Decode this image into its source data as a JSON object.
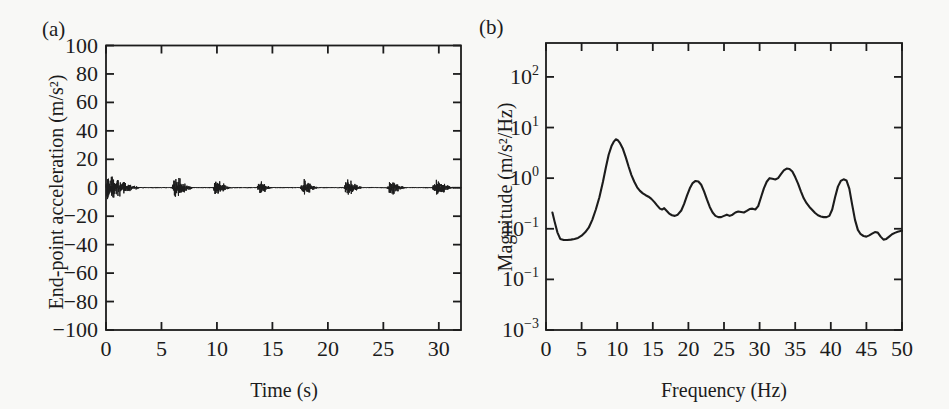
{
  "figure": {
    "background": "#f8f8f6",
    "ink": "#1c1c1c",
    "panels": {
      "a": {
        "tag": "(a)",
        "xlabel": "Time (s)",
        "ylabel": "End-point acceleration (m/s²)"
      },
      "b": {
        "tag": "(b)",
        "xlabel": "Frequency (Hz)",
        "ylabel": "Magnitude (m/s²/Hz)"
      }
    }
  },
  "chart_data": [
    {
      "id": "a",
      "type": "line",
      "subtype": "acceleration-waveform",
      "title": "",
      "xlabel": "Time (s)",
      "ylabel": "End-point acceleration (m/s²)",
      "xlim": [
        0,
        32
      ],
      "ylim": [
        -100,
        100
      ],
      "grid": false,
      "box": true,
      "tick_direction": "in",
      "xticks": [
        0,
        5,
        10,
        15,
        20,
        25,
        30
      ],
      "xtick_labels": [
        "0",
        "5",
        "10",
        "15",
        "20",
        "25",
        "30"
      ],
      "yticks": [
        100,
        80,
        60,
        40,
        20,
        0,
        -20,
        -40,
        -60,
        -80,
        -100
      ],
      "ytick_labels": [
        "100",
        "80",
        "60",
        "40",
        "20",
        "0",
        "−20",
        "−40",
        "−60",
        "−80",
        "−100"
      ],
      "baseline_value": 0,
      "baseline_noise_amp": 0.25,
      "bursts": [
        {
          "start": 0.0,
          "end": 3.5,
          "amp": 13.0,
          "shape": "decay"
        },
        {
          "start": 5.9,
          "end": 8.0,
          "amp": 10.0,
          "shape": "burst"
        },
        {
          "start": 9.6,
          "end": 11.5,
          "amp": 7.0,
          "shape": "burst"
        },
        {
          "start": 13.6,
          "end": 15.1,
          "amp": 6.0,
          "shape": "burst"
        },
        {
          "start": 17.5,
          "end": 19.3,
          "amp": 7.5,
          "shape": "burst"
        },
        {
          "start": 21.4,
          "end": 23.3,
          "amp": 8.5,
          "shape": "burst"
        },
        {
          "start": 25.3,
          "end": 27.2,
          "amp": 7.0,
          "shape": "burst"
        },
        {
          "start": 29.4,
          "end": 31.5,
          "amp": 8.5,
          "shape": "burst"
        }
      ]
    },
    {
      "id": "b",
      "type": "line",
      "subtype": "magnitude-spectrum",
      "title": "",
      "xlabel": "Frequency (Hz)",
      "ylabel": "Magnitude (m/s²/Hz)",
      "xlim": [
        0,
        50
      ],
      "yscale": "log",
      "ylim": [
        0.001,
        468
      ],
      "grid": false,
      "box": true,
      "tick_direction": "in",
      "xticks": [
        0,
        5,
        10,
        15,
        20,
        25,
        30,
        35,
        40,
        45,
        50
      ],
      "xtick_labels": [
        "0",
        "5",
        "10",
        "15",
        "20",
        "25",
        "30",
        "35",
        "40",
        "45",
        "50"
      ],
      "yticks": [
        {
          "value": 100,
          "base": "10",
          "exp": "2"
        },
        {
          "value": 10,
          "base": "10",
          "exp": "1"
        },
        {
          "value": 1,
          "base": "10",
          "exp": "0"
        },
        {
          "value": 0.1,
          "base": "10",
          "exp": "−1"
        },
        {
          "value": 0.01,
          "base": "10",
          "exp": "−1"
        },
        {
          "value": 0.001,
          "base": "10",
          "exp": "−3"
        }
      ],
      "points": [
        [
          0.9,
          0.21
        ],
        [
          1.2,
          0.14
        ],
        [
          1.6,
          0.085
        ],
        [
          2,
          0.063
        ],
        [
          2.5,
          0.06
        ],
        [
          3,
          0.06
        ],
        [
          3.5,
          0.061
        ],
        [
          4,
          0.063
        ],
        [
          4.5,
          0.066
        ],
        [
          5,
          0.073
        ],
        [
          5.5,
          0.085
        ],
        [
          6,
          0.105
        ],
        [
          6.5,
          0.15
        ],
        [
          7,
          0.24
        ],
        [
          7.5,
          0.42
        ],
        [
          8,
          0.85
        ],
        [
          8.4,
          1.6
        ],
        [
          8.8,
          2.9
        ],
        [
          9.2,
          4.3
        ],
        [
          9.5,
          5.2
        ],
        [
          9.8,
          5.85
        ],
        [
          10.1,
          5.6
        ],
        [
          10.4,
          4.9
        ],
        [
          10.8,
          3.8
        ],
        [
          11.2,
          2.6
        ],
        [
          11.6,
          1.7
        ],
        [
          12,
          1.15
        ],
        [
          12.4,
          0.85
        ],
        [
          12.8,
          0.66
        ],
        [
          13.2,
          0.56
        ],
        [
          13.6,
          0.5
        ],
        [
          14,
          0.46
        ],
        [
          14.4,
          0.43
        ],
        [
          14.8,
          0.39
        ],
        [
          15.2,
          0.34
        ],
        [
          15.6,
          0.29
        ],
        [
          16,
          0.25
        ],
        [
          16.3,
          0.24
        ],
        [
          16.6,
          0.255
        ],
        [
          16.9,
          0.23
        ],
        [
          17.3,
          0.2
        ],
        [
          17.7,
          0.185
        ],
        [
          18.1,
          0.18
        ],
        [
          18.5,
          0.19
        ],
        [
          19,
          0.23
        ],
        [
          19.4,
          0.31
        ],
        [
          19.8,
          0.45
        ],
        [
          20.2,
          0.63
        ],
        [
          20.6,
          0.8
        ],
        [
          21,
          0.88
        ],
        [
          21.4,
          0.86
        ],
        [
          21.8,
          0.74
        ],
        [
          22.2,
          0.55
        ],
        [
          22.6,
          0.38
        ],
        [
          23,
          0.27
        ],
        [
          23.4,
          0.21
        ],
        [
          23.8,
          0.18
        ],
        [
          24.2,
          0.17
        ],
        [
          24.6,
          0.17
        ],
        [
          25,
          0.18
        ],
        [
          25.4,
          0.19
        ],
        [
          25.8,
          0.18
        ],
        [
          26.2,
          0.19
        ],
        [
          26.6,
          0.21
        ],
        [
          27,
          0.22
        ],
        [
          27.4,
          0.215
        ],
        [
          27.8,
          0.21
        ],
        [
          28.2,
          0.225
        ],
        [
          28.6,
          0.245
        ],
        [
          29,
          0.25
        ],
        [
          29.4,
          0.24
        ],
        [
          29.8,
          0.28
        ],
        [
          30.2,
          0.42
        ],
        [
          30.6,
          0.63
        ],
        [
          31,
          0.85
        ],
        [
          31.4,
          1.0
        ],
        [
          31.8,
          0.97
        ],
        [
          32.2,
          0.94
        ],
        [
          32.6,
          1.0
        ],
        [
          33,
          1.2
        ],
        [
          33.4,
          1.42
        ],
        [
          33.8,
          1.55
        ],
        [
          34.2,
          1.52
        ],
        [
          34.6,
          1.35
        ],
        [
          35,
          1.05
        ],
        [
          35.4,
          0.78
        ],
        [
          35.8,
          0.55
        ],
        [
          36.2,
          0.4
        ],
        [
          36.6,
          0.32
        ],
        [
          37,
          0.27
        ],
        [
          37.4,
          0.235
        ],
        [
          37.8,
          0.205
        ],
        [
          38.2,
          0.185
        ],
        [
          38.6,
          0.175
        ],
        [
          39,
          0.17
        ],
        [
          39.4,
          0.17
        ],
        [
          39.8,
          0.18
        ],
        [
          40.2,
          0.24
        ],
        [
          40.6,
          0.42
        ],
        [
          41,
          0.68
        ],
        [
          41.4,
          0.88
        ],
        [
          41.8,
          0.95
        ],
        [
          42.2,
          0.9
        ],
        [
          42.6,
          0.62
        ],
        [
          43,
          0.3
        ],
        [
          43.4,
          0.15
        ],
        [
          43.8,
          0.095
        ],
        [
          44.2,
          0.078
        ],
        [
          44.6,
          0.072
        ],
        [
          45,
          0.07
        ],
        [
          45.4,
          0.074
        ],
        [
          45.8,
          0.08
        ],
        [
          46.2,
          0.086
        ],
        [
          46.6,
          0.084
        ],
        [
          47,
          0.07
        ],
        [
          47.4,
          0.061
        ],
        [
          47.8,
          0.063
        ],
        [
          48.2,
          0.07
        ],
        [
          48.6,
          0.078
        ],
        [
          49,
          0.083
        ],
        [
          49.4,
          0.087
        ],
        [
          49.8,
          0.09
        ],
        [
          50,
          0.091
        ]
      ]
    }
  ]
}
